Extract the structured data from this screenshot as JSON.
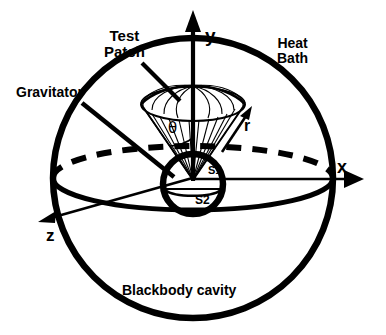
{
  "figure": {
    "background_color": "#ffffff",
    "ink_color": "#000000"
  },
  "labels": {
    "test_patch": "Test\nPatch",
    "gravitator": "Gravitator",
    "heat_bath": "Heat\nBath",
    "blackbody_cavity": "Blackbody cavity",
    "axis_x": "x",
    "axis_y": "y",
    "axis_z": "z",
    "radius_vector": "r",
    "polar_angle": "θ",
    "surface_upper": "S1",
    "surface_lower": "S2"
  },
  "geometry": {
    "outer_sphere": {
      "name": "blackbody-cavity-sphere",
      "center_x": 193,
      "center_y": 178,
      "radius": 140,
      "stroke_width": 6
    },
    "equator_ellipse": {
      "name": "equator-ellipse",
      "center_x": 193,
      "center_y": 178,
      "rx": 140,
      "ry": 32,
      "back_half_dashed": true,
      "front_half_solid": true,
      "stroke_width": 5
    },
    "gravitator_sphere": {
      "name": "gravitator-sphere",
      "center_x": 193,
      "center_y": 184,
      "radius": 30,
      "stroke_width": 6,
      "divider_label_upper": "S1",
      "divider_label_lower": "S2"
    },
    "cone": {
      "name": "solid-angle-cone",
      "apex_x": 193,
      "apex_y": 180,
      "cap_center_y": 104,
      "cap_rx": 52,
      "cap_ry": 16,
      "meridian_count": 13
    },
    "axes": {
      "x": {
        "from_x": 193,
        "from_y": 178,
        "to_x": 362,
        "to_y": 178
      },
      "y": {
        "from_x": 193,
        "from_y": 180,
        "to_x": 193,
        "to_y": 12
      },
      "z": {
        "from_x": 193,
        "from_y": 178,
        "to_x": 38,
        "to_y": 222
      }
    },
    "pointers": {
      "test_patch_leader": {
        "from_x": 140,
        "from_y": 62,
        "to_x": 182,
        "to_y": 103
      },
      "gravitator_leader": {
        "from_x": 82,
        "from_y": 104,
        "to_x": 172,
        "to_y": 176
      }
    }
  }
}
